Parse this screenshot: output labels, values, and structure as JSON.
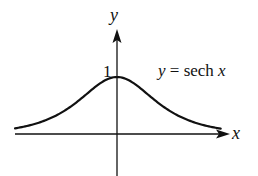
{
  "chart_data": {
    "type": "line",
    "title": "",
    "function": "y = sech x",
    "xlabel": "x",
    "ylabel": "y",
    "annotations": [
      {
        "text": "y = sech x",
        "position": "upper-right"
      },
      {
        "text": "1",
        "position": "y-axis at peak"
      }
    ],
    "x": [
      -3,
      -2.5,
      -2,
      -1.5,
      -1,
      -0.5,
      0,
      0.5,
      1,
      1.5,
      2,
      2.5,
      3
    ],
    "values": [
      0.099,
      0.163,
      0.266,
      0.425,
      0.648,
      0.887,
      1.0,
      0.887,
      0.648,
      0.425,
      0.266,
      0.163,
      0.099
    ],
    "xlim": [
      -3.2,
      3.5
    ],
    "ylim": [
      -0.9,
      2.0
    ],
    "grid": false,
    "legend": "none",
    "colors": {
      "curve": "#111111",
      "axes": "#111111"
    }
  },
  "labels": {
    "y_axis": "y",
    "x_axis": "x",
    "tick_one": "1",
    "equation_y": "y",
    "equation_rest": " = sech ",
    "equation_x": "x"
  }
}
